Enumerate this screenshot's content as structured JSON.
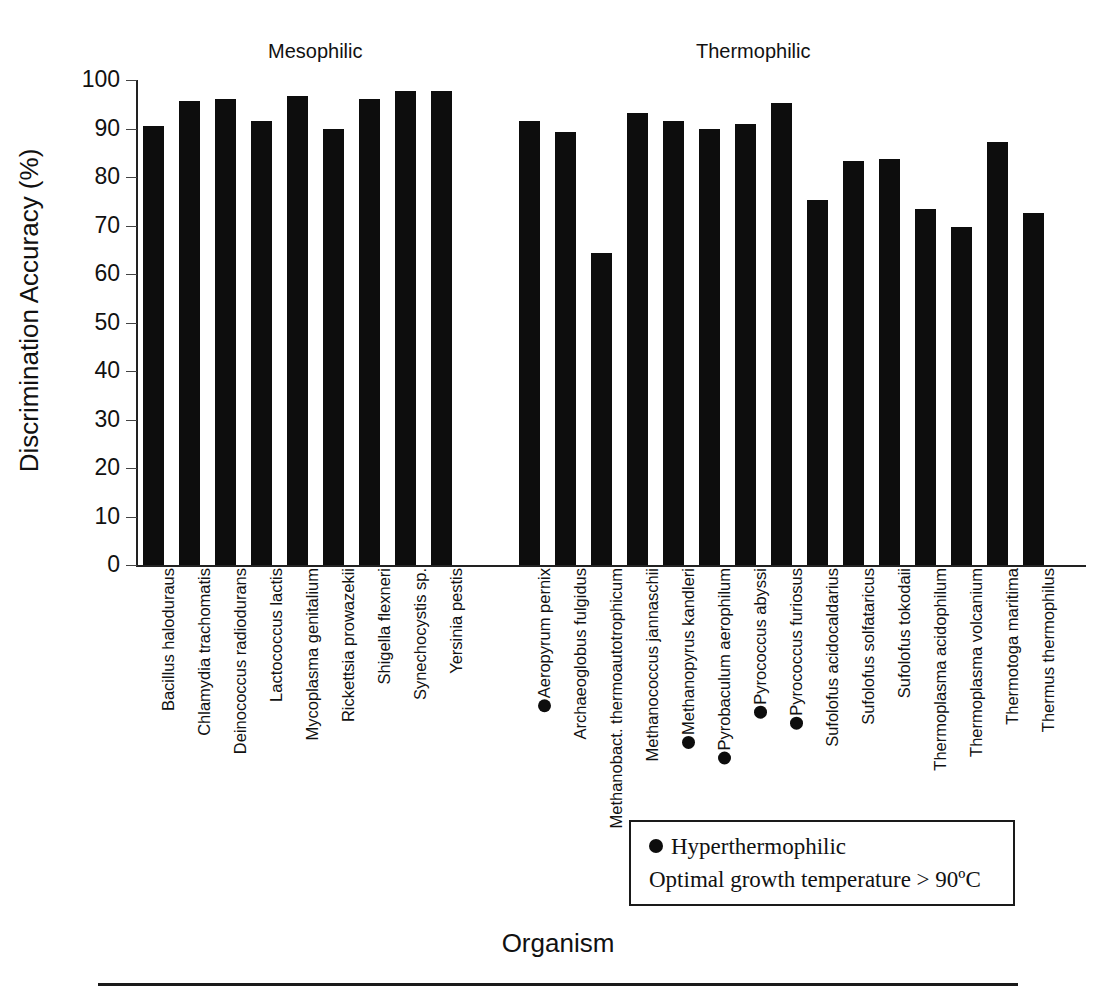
{
  "axes": {
    "ylabel": "Discrimination Accuracy (%)",
    "xlabel": "Organism",
    "yticks": [
      "100",
      "90",
      "80",
      "70",
      "60",
      "50",
      "40",
      "30",
      "20",
      "10",
      "0"
    ],
    "ymin": 0,
    "ymax": 100
  },
  "groups": {
    "mesophilic": "Mesophilic",
    "thermophilic": "Thermophilic"
  },
  "legend": {
    "marker_label": "Hyperthermophilic",
    "description": "Optimal growth temperature > 90ºC"
  },
  "colors": {
    "bar": "#0d0d0d",
    "axis": "#222222",
    "background": "#ffffff"
  },
  "chart_data": {
    "type": "bar",
    "title": "",
    "xlabel": "Organism",
    "ylabel": "Discrimination Accuracy (%)",
    "ylim": [
      0,
      100
    ],
    "ytick_step": 10,
    "grid": false,
    "legend_position": "inside-bottom-right",
    "categories": [
      "Bacillus haloduraus",
      "Chlamydia trachomatis",
      "Deinococcus radiodurans",
      "Lactococcus lactis",
      "Mycoplasma genitalium",
      "Rickettsia prowazekii",
      "Shigella flexneri",
      "Synechocystis sp.",
      "Yersinia pestis",
      "Aeropyrum pernix",
      "Archaeoglobus fulgidus",
      "Methanobact. thermoautotrophicum",
      "Methanococcus jannaschii",
      "Methanopyrus kandleri",
      "Pyrobaculum aerophilum",
      "Pyrococcus abyssi",
      "Pyrococcus furiosus",
      "Sufolofus acidocaldarius",
      "Sufolofus solfataricus",
      "Sufolofus tokodaii",
      "Thermoplasma acidophilum",
      "Thermoplasma volcanium",
      "Thermotoga maritima",
      "Thermus thermophilus"
    ],
    "values": [
      90.5,
      95.6,
      96.0,
      91.5,
      96.7,
      90.0,
      96.0,
      97.7,
      97.7,
      91.5,
      89.3,
      64.4,
      93.2,
      91.5,
      89.8,
      90.9,
      95.2,
      75.3,
      83.3,
      83.8,
      73.5,
      69.6,
      87.3,
      72.6
    ],
    "group_of": [
      "mesophilic",
      "mesophilic",
      "mesophilic",
      "mesophilic",
      "mesophilic",
      "mesophilic",
      "mesophilic",
      "mesophilic",
      "mesophilic",
      "thermophilic",
      "thermophilic",
      "thermophilic",
      "thermophilic",
      "thermophilic",
      "thermophilic",
      "thermophilic",
      "thermophilic",
      "thermophilic",
      "thermophilic",
      "thermophilic",
      "thermophilic",
      "thermophilic",
      "thermophilic",
      "thermophilic"
    ],
    "hyperthermophilic": [
      "Aeropyrum pernix",
      "Methanopyrus kandleri",
      "Pyrobaculum aerophilum",
      "Pyrococcus abyssi",
      "Pyrococcus furiosus"
    ]
  }
}
